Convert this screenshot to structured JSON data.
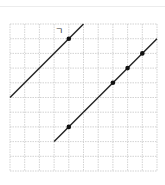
{
  "diagram": {
    "type": "grid-lines-points",
    "grid": {
      "cols": 10,
      "rows": 10,
      "origin_px": [
        10,
        24
      ],
      "cell_px": 14.7,
      "line_color": "#c8c8c8",
      "dashed": true
    },
    "lines": [
      {
        "id": "line-1",
        "from": [
          0,
          5
        ],
        "to": [
          5,
          0
        ],
        "label": "ㄱ",
        "label_pos": [
          3.2,
          0.45
        ]
      },
      {
        "id": "line-2",
        "from": [
          3,
          8
        ],
        "to": [
          10,
          1
        ],
        "label": ""
      }
    ],
    "points": [
      {
        "line": "line-1",
        "at": [
          4,
          1
        ]
      },
      {
        "line": "line-2",
        "at": [
          4,
          7
        ]
      },
      {
        "line": "line-2",
        "at": [
          7,
          4
        ]
      },
      {
        "line": "line-2",
        "at": [
          8,
          3
        ]
      },
      {
        "line": "line-2",
        "at": [
          9,
          2
        ]
      }
    ],
    "colors": {
      "line": "#222222",
      "point": "#111111",
      "grid": "#c8c8c8"
    }
  }
}
